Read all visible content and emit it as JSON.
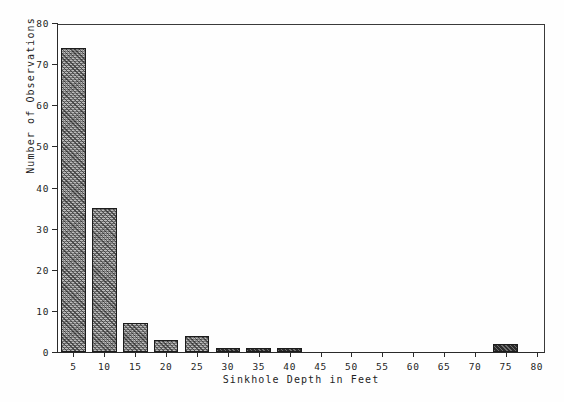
{
  "chart_data": {
    "type": "bar",
    "title": "",
    "subtitle": "",
    "xlabel": "Sinkhole Depth in Feet",
    "ylabel": "Number of Observations",
    "categories": [
      5,
      10,
      15,
      20,
      25,
      30,
      35,
      40,
      45,
      50,
      55,
      60,
      65,
      70,
      75,
      80
    ],
    "values": [
      74,
      35,
      7,
      3,
      4,
      1,
      1,
      1,
      0,
      0,
      0,
      0,
      0,
      0,
      2,
      0
    ],
    "xlim": [
      2.5,
      81.5
    ],
    "ylim": [
      0,
      80
    ],
    "xticks": [
      5,
      10,
      15,
      20,
      25,
      30,
      35,
      40,
      45,
      50,
      55,
      60,
      65,
      70,
      75,
      80
    ],
    "xtick_labels": [
      "5",
      "10",
      "15",
      "20",
      "25",
      "30",
      "35",
      "40",
      "45",
      "50",
      "55",
      "60",
      "65",
      "70",
      "75",
      "80"
    ],
    "yticks": [
      0,
      10,
      20,
      30,
      40,
      50,
      60,
      70,
      80
    ],
    "ytick_labels": [
      "0",
      "10",
      "20",
      "30",
      "40",
      "50",
      "60",
      "70",
      "80"
    ],
    "bar_width": 4,
    "grid": false,
    "legend": null,
    "annotations": [],
    "colors": {
      "bar_fill": "#9a9a9a",
      "bar_edge": "#1c1c1c",
      "axis": "#2a2a2a",
      "text": "#1f1f1f",
      "background": "#fefefe"
    }
  }
}
